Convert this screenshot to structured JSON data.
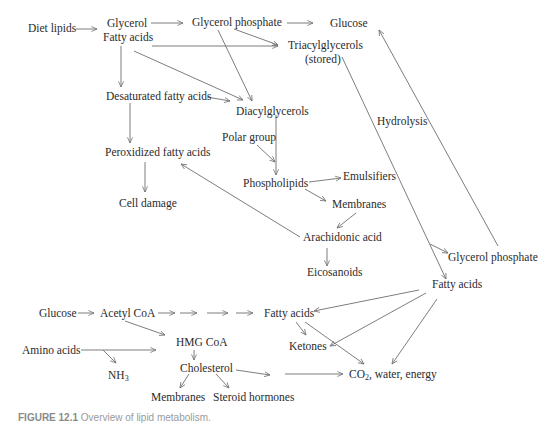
{
  "diagram": {
    "title": "Overview of lipid metabolism",
    "line_color": "#6e6e6e",
    "text_color": "#2b2b2b",
    "nodes": {
      "diet_lipids": "Diet lipids",
      "glycerol": "Glycerol",
      "fatty_acids_top": "Fatty acids",
      "glycerol_phosphate_top": "Glycerol phosphate",
      "glucose_top": "Glucose",
      "triacylglycerols": "Triacylglycerols",
      "stored": "(stored)",
      "desaturated_fatty_acids": "Desaturated fatty acids",
      "diacylglycerols": "Diacylglycerols",
      "hydrolysis": "Hydrolysis",
      "polar_group": "Polar group",
      "peroxidized_fatty_acids": "Peroxidized fatty acids",
      "phospholipids": "Phospholipids",
      "emulsifiers": "Emulsifiers",
      "cell_damage": "Cell damage",
      "membranes_mid": "Membranes",
      "arachidonic_acid": "Arachidonic acid",
      "eicosanoids": "Eicosanoids",
      "glycerol_phosphate_right": "Glycerol phosphate",
      "fatty_acids_right": "Fatty acids",
      "glucose_bottom": "Glucose",
      "acetyl_coa": "Acetyl CoA",
      "fatty_acids_bottom": "Fatty acids",
      "hmg_coa": "HMG CoA",
      "amino_acids": "Amino acids",
      "ketones": "Ketones",
      "nh3_main": "NH",
      "nh3_sub": "3",
      "cholesterol": "Cholesterol",
      "co2_main": "CO",
      "co2_sub": "2",
      "co2_rest": ", water, energy",
      "membranes_bottom": "Membranes",
      "steroid_hormones": "Steroid hormones"
    },
    "edges": [
      [
        "Diet lipids",
        "Glycerol / Fatty acids"
      ],
      [
        "Glycerol",
        "Glycerol phosphate"
      ],
      [
        "Glycerol phosphate",
        "Glucose"
      ],
      [
        "Glycerol phosphate",
        "Triacylglycerols"
      ],
      [
        "Glycerol phosphate",
        "Diacylglycerols"
      ],
      [
        "Fatty acids",
        "Triacylglycerols"
      ],
      [
        "Fatty acids",
        "Desaturated fatty acids"
      ],
      [
        "Fatty acids",
        "Diacylglycerols"
      ],
      [
        "Desaturated fatty acids",
        "Diacylglycerols"
      ],
      [
        "Desaturated fatty acids",
        "Peroxidized fatty acids"
      ],
      [
        "Peroxidized fatty acids",
        "Cell damage"
      ],
      [
        "Diacylglycerols",
        "Phospholipids"
      ],
      [
        "Polar group",
        "Phospholipids"
      ],
      [
        "Phospholipids",
        "Emulsifiers"
      ],
      [
        "Phospholipids",
        "Membranes"
      ],
      [
        "Membranes",
        "Arachidonic acid"
      ],
      [
        "Arachidonic acid",
        "Peroxidized fatty acids"
      ],
      [
        "Arachidonic acid",
        "Eicosanoids"
      ],
      [
        "Triacylglycerols",
        "Fatty acids (Hydrolysis)"
      ],
      [
        "Triacylglycerols",
        "Glycerol phosphate (Hydrolysis)"
      ],
      [
        "Glycerol phosphate",
        "Glucose"
      ],
      [
        "Glucose",
        "Acetyl CoA"
      ],
      [
        "Acetyl CoA",
        "Fatty acids"
      ],
      [
        "Acetyl CoA",
        "HMG CoA"
      ],
      [
        "Amino acids",
        "HMG CoA"
      ],
      [
        "Amino acids",
        "NH3"
      ],
      [
        "HMG CoA",
        "Cholesterol"
      ],
      [
        "Cholesterol",
        "Membranes"
      ],
      [
        "Cholesterol",
        "Steroid hormones"
      ],
      [
        "Cholesterol",
        "CO2, water, energy"
      ],
      [
        "Fatty acids (right)",
        "Fatty acids (bottom)"
      ],
      [
        "Fatty acids (right)",
        "Ketones"
      ],
      [
        "Fatty acids (right)",
        "CO2, water, energy"
      ],
      [
        "Fatty acids (bottom)",
        "Ketones"
      ],
      [
        "Fatty acids (bottom)",
        "CO2, water, energy"
      ]
    ]
  },
  "caption": {
    "label": "FIGURE 12.1",
    "text": "Overview of lipid metabolism."
  }
}
